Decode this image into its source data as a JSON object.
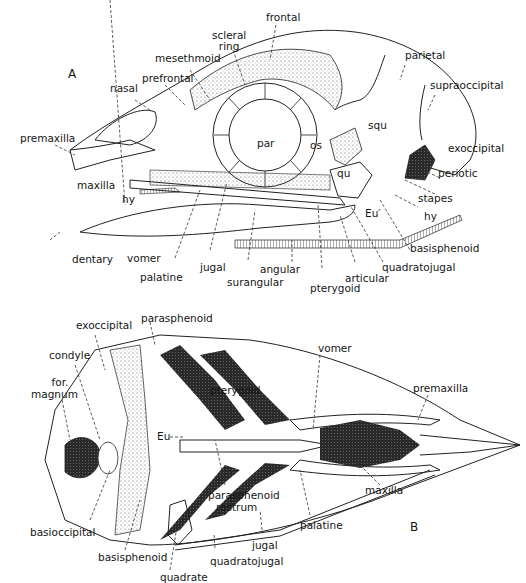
{
  "figure": {
    "panels": [
      {
        "id": "A",
        "label": "A",
        "view": "lateral skull",
        "labels": {
          "scleral_ring": "scleral\nring",
          "frontal": "frontal",
          "mesethmoid": "mesethmoid",
          "prefrontal": "prefrontal",
          "nasal": "nasal",
          "parietal": "parietal",
          "supraoccipital": "supraoccipital",
          "premaxilla": "premaxilla",
          "par": "par",
          "os": "os",
          "squ": "squ",
          "exoccipital": "exoccipital",
          "qu": "qu",
          "periotic": "periotic",
          "maxilla": "maxilla",
          "hy_left": "hy",
          "stapes": "stapes",
          "eu": "Eu′",
          "hy_right": "hy",
          "basisphenoid": "basisphenoid",
          "dentary": "dentary",
          "vomer": "vomer",
          "palatine": "palatine",
          "jugal": "jugal",
          "angular": "angular",
          "surangular": "surangular",
          "pterygoid": "pterygoid",
          "articular": "articular",
          "quadratojugal": "quadratojugal"
        }
      },
      {
        "id": "B",
        "label": "B",
        "view": "ventral skull",
        "labels": {
          "exoccipital": "exoccipital",
          "parasphenoid": "parasphenoid",
          "condyle": "condyle",
          "for_magnum_1": "for.",
          "for_magnum_2": "magnum",
          "vomer": "vomer",
          "pterygoid": "pterygoid",
          "premaxilla": "premaxilla",
          "eu": "Eu",
          "maxilla": "maxilla",
          "parasphenoid_rostrum_1": "parasphenoid",
          "parasphenoid_rostrum_2": "rostrum",
          "palatine": "palatine",
          "basioccipital": "basioccipital",
          "basisphenoid": "basisphenoid",
          "jugal": "jugal",
          "quadratojugal": "quadratojugal",
          "quadrate": "quadrate"
        }
      }
    ]
  }
}
